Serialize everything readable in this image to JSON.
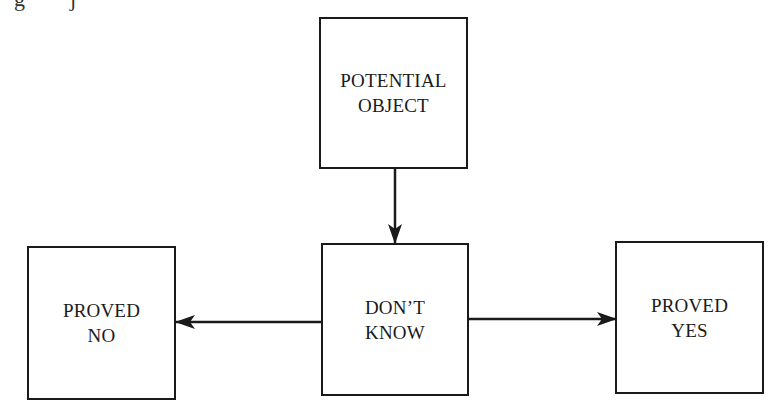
{
  "diagram": {
    "nodes": [
      {
        "id": "potential",
        "lines": [
          "POTENTIAL",
          "OBJECT"
        ]
      },
      {
        "id": "dont_know",
        "lines": [
          "DON’T",
          "KNOW"
        ]
      },
      {
        "id": "proved_no",
        "lines": [
          "PROVED",
          "NO"
        ]
      },
      {
        "id": "proved_yes",
        "lines": [
          "PROVED",
          "YES"
        ]
      }
    ],
    "edges": [
      {
        "from": "potential",
        "to": "dont_know"
      },
      {
        "from": "dont_know",
        "to": "proved_no"
      },
      {
        "from": "dont_know",
        "to": "proved_yes"
      }
    ],
    "colors": {
      "stroke": "#1a1a1a",
      "background": "#ffffff"
    }
  }
}
